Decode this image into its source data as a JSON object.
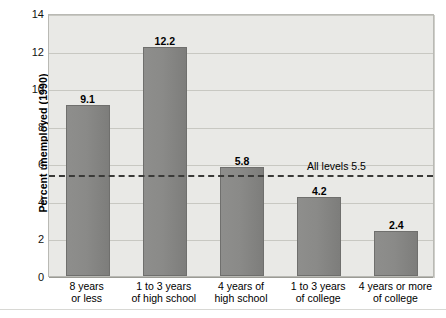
{
  "chart_data": {
    "type": "bar",
    "title": "",
    "subtitle": "",
    "xlabel": "",
    "ylabel": "Percent unemployed (1990)",
    "ylim": [
      0,
      14
    ],
    "ytick_step": 2,
    "yticks": [
      "0",
      "2",
      "4",
      "6",
      "8",
      "10",
      "12",
      "14"
    ],
    "grid": true,
    "legend": "none",
    "categories": [
      "8 years\nor less",
      "1 to 3 years\nof high school",
      "4 years of\nhigh school",
      "1 to 3 years\nof college",
      "4 years or more\nof college"
    ],
    "category_lines": [
      [
        "8 years",
        "or less"
      ],
      [
        "1 to 3 years",
        "of high school"
      ],
      [
        "4 years of",
        "high school"
      ],
      [
        "1 to 3 years",
        "of college"
      ],
      [
        "4 years or more",
        "of college"
      ]
    ],
    "values": [
      9.1,
      12.2,
      5.8,
      4.2,
      2.4
    ],
    "value_labels": [
      "9.1",
      "12.2",
      "5.8",
      "4.2",
      "2.4"
    ],
    "annotations": [
      {
        "name": "all-levels-reference",
        "label": "All levels 5.5",
        "value": 5.5,
        "style": "dashed-horizontal-line"
      }
    ],
    "colors": {
      "bar_fill": "#8a8a88",
      "bar_border": "#6f6f6d",
      "plot_background": "#e9e9e6",
      "gridline": "#c8c8c2",
      "reference_line": "#3a3a38",
      "page_background": "#ffffff",
      "text": "#000000"
    }
  },
  "axis": {
    "y_title": "Percent unemployed (1990)"
  }
}
